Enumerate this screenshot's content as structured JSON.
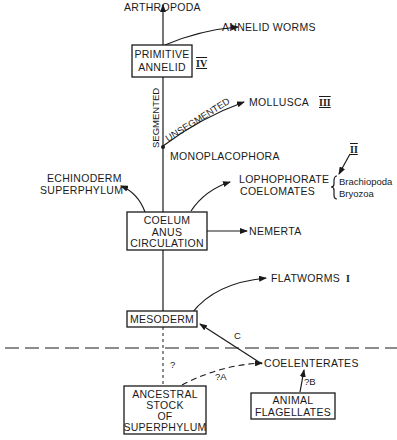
{
  "diagram": {
    "top": {
      "arthropoda": "ARTHROPODA",
      "annelid_worms": "ANNELID WORMS"
    },
    "primitive_annelid": {
      "line1": "PRIMITIVE",
      "line2": "ANNELID",
      "roman": "IV"
    },
    "branches": {
      "segmented": "SEGMENTED",
      "unsegmented": "UNSEGMENTED",
      "mollusca": "MOLLUSCA",
      "mollusca_roman": "III",
      "monoplacophora": "MONOPLACOPHORA"
    },
    "lophophorate": {
      "line1": "LOPHOPHORATE",
      "line2": "COELOMATES",
      "roman": "II",
      "sub1": "Brachiopoda",
      "sub2": "Bryozoa"
    },
    "echinoderm": {
      "line1": "ECHINODERM",
      "line2": "SUPERPHYLUM"
    },
    "coelum_box": {
      "line1": "COELUM",
      "line2": "ANUS",
      "line3": "CIRCULATION"
    },
    "nemerta": "NEMERTA",
    "flatworms": {
      "label": "FLATWORMS",
      "roman": "I"
    },
    "mesoderm": "MESODERM",
    "arrow_labels": {
      "c": "C",
      "q": "?",
      "qa": "?A",
      "qb": "?B"
    },
    "coelenterates": "COELENTERATES",
    "ancestral_box": {
      "line1": "ANCESTRAL",
      "line2": "STOCK",
      "line3": "OF",
      "line4": "SUPERPHYLUM"
    },
    "flagellates_box": {
      "line1": "ANIMAL",
      "line2": "FLAGELLATES"
    }
  }
}
